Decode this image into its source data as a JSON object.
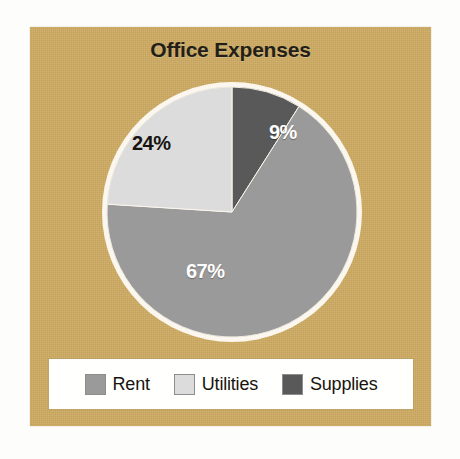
{
  "figure": {
    "background_color": "#fdfdfb",
    "panel_color": "#cdaa61"
  },
  "chart_data": {
    "type": "pie",
    "title": "Office Expenses",
    "subtitle": "",
    "xlabel": "",
    "ylabel": "",
    "categories": [
      "Rent",
      "Utilities",
      "Supplies"
    ],
    "values": [
      67,
      24,
      9
    ],
    "value_unit": "%",
    "data_labels": [
      "67%",
      "24%",
      "9%"
    ],
    "colors": [
      "#9a9a9a",
      "#dcdcdc",
      "#595959"
    ],
    "start_angle_deg": 0,
    "direction": "clockwise",
    "slice_order": [
      "Supplies",
      "Rent",
      "Utilities"
    ],
    "legend": {
      "position": "bottom",
      "entries": [
        {
          "label": "Rent",
          "color": "#9a9a9a",
          "value": 67
        },
        {
          "label": "Utilities",
          "color": "#dcdcdc",
          "value": 24
        },
        {
          "label": "Supplies",
          "color": "#595959",
          "value": 9
        }
      ]
    },
    "grid": false,
    "outline_color": "#fbf7ee"
  },
  "labels": {
    "supplies_pct": "9%",
    "utilities_pct": "24%",
    "rent_pct": "67%"
  }
}
